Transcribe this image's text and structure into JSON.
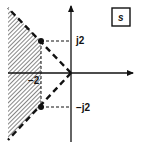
{
  "diagram": {
    "plane_label": "s",
    "labels": {
      "pos_imag": "j2",
      "neg_imag": "−j2",
      "neg_real": "−2"
    },
    "poles": [
      {
        "re": -2,
        "im": 2
      },
      {
        "re": -2,
        "im": -2
      }
    ],
    "shaded_region": "Re(s) < -2 within the wedge bounded by the rays through the poles",
    "colors": {
      "ink": "#111111",
      "background": "#ffffff"
    }
  }
}
